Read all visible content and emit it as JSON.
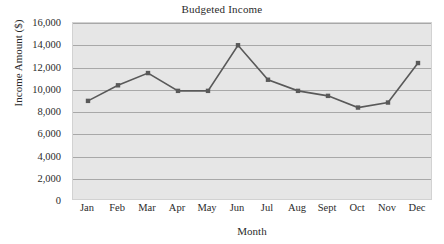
{
  "chart_data": {
    "type": "line",
    "title": "Budgeted Income",
    "xlabel": "Month",
    "ylabel": "Income Amount ($)",
    "categories": [
      "Jan",
      "Feb",
      "Mar",
      "Apr",
      "May",
      "Jun",
      "Jul",
      "Aug",
      "Sept",
      "Oct",
      "Nov",
      "Dec"
    ],
    "values": [
      9000,
      10400,
      11500,
      9900,
      9900,
      14000,
      10900,
      9900,
      9450,
      8400,
      8850,
      12400
    ],
    "series": [
      {
        "name": "Budgeted Income",
        "values": [
          9000,
          10400,
          11500,
          9900,
          9900,
          14000,
          10900,
          9900,
          9450,
          8400,
          8850,
          12400
        ]
      }
    ],
    "ylim": [
      0,
      16000
    ],
    "ytick_step": 2000,
    "ytick_labels": [
      "16,000",
      "14,000",
      "12,000",
      "10,000",
      "8,000",
      "6,000",
      "4,000",
      "2,000",
      "0"
    ],
    "ytick_values": [
      16000,
      14000,
      12000,
      10000,
      8000,
      6000,
      4000,
      2000,
      0
    ],
    "grid": true,
    "grid_axis": "y",
    "legend": false,
    "legend_position": "none",
    "marker": "square",
    "line_color": "#595959",
    "marker_color": "#595959",
    "plot_background": "#e6e6e6",
    "gridline_color": "#a8a8a8",
    "text_color": "#2b2b2b"
  }
}
